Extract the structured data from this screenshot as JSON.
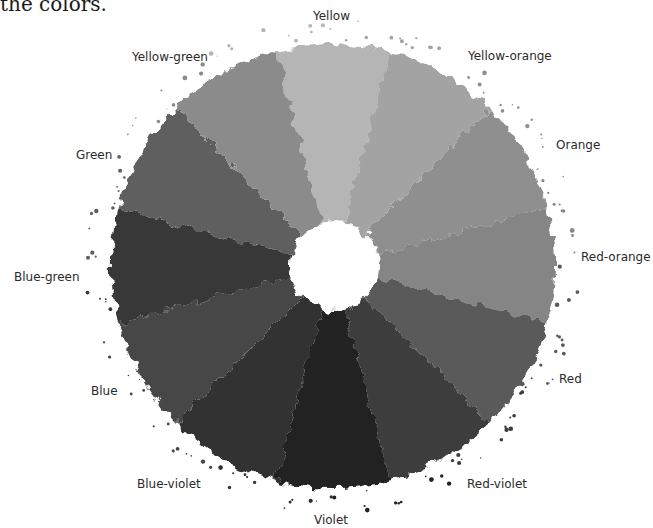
{
  "caption": "the colors.",
  "diagram": {
    "center": {
      "x": 333,
      "y": 266
    },
    "outer_radius": 222,
    "inner_radius": 45,
    "segments": [
      {
        "name": "Yellow",
        "shade": "#b5b5b5",
        "label_x": 313,
        "label_y": 9
      },
      {
        "name": "Yellow-orange",
        "shade": "#a3a3a3",
        "label_x": 468,
        "label_y": 49
      },
      {
        "name": "Orange",
        "shade": "#8f8f8f",
        "label_x": 556,
        "label_y": 138
      },
      {
        "name": "Red-orange",
        "shade": "#858585",
        "label_x": 581,
        "label_y": 250
      },
      {
        "name": "Red",
        "shade": "#5a5a5a",
        "label_x": 559,
        "label_y": 372
      },
      {
        "name": "Red-violet",
        "shade": "#3c3c3c",
        "label_x": 467,
        "label_y": 477
      },
      {
        "name": "Violet",
        "shade": "#222222",
        "label_x": 314,
        "label_y": 513
      },
      {
        "name": "Blue-violet",
        "shade": "#303030",
        "label_x": 137,
        "label_y": 477
      },
      {
        "name": "Blue",
        "shade": "#464646",
        "label_x": 91,
        "label_y": 384
      },
      {
        "name": "Blue-green",
        "shade": "#393939",
        "label_x": 14,
        "label_y": 270
      },
      {
        "name": "Green",
        "shade": "#5f5f5f",
        "label_x": 76,
        "label_y": 148
      },
      {
        "name": "Yellow-green",
        "shade": "#8b8b8b",
        "label_x": 132,
        "label_y": 50
      }
    ]
  }
}
